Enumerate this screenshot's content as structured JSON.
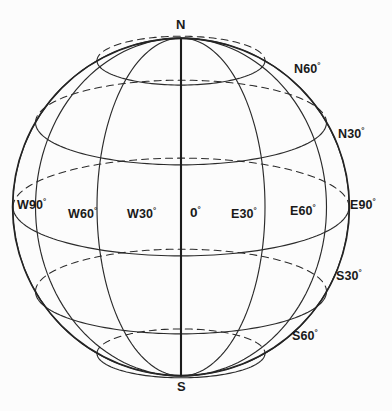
{
  "figure": {
    "background_color": "#fcfcfc",
    "line_color": "#2b2b2b",
    "axis_color": "#1c1c1c",
    "label_color": "#1a1a1a"
  },
  "geometry": {
    "center_x": 181,
    "center_y": 207,
    "radius_x": 168,
    "radius_y": 169,
    "latitude_step_deg": 30,
    "longitude_step_deg": 30,
    "latitudes_deg": [
      60,
      30,
      0,
      -30,
      -60
    ],
    "longitudes_deg": [
      -90,
      -60,
      -30,
      0,
      30,
      60,
      90
    ]
  },
  "labels": {
    "north_pole": {
      "text": "N",
      "x": 176,
      "y": 18
    },
    "south_pole": {
      "text": "S",
      "x": 177,
      "y": 380
    },
    "latitude": [
      {
        "text": "N60",
        "degree": "°",
        "x": 294,
        "y": 63
      },
      {
        "text": "N30",
        "degree": "°",
        "x": 338,
        "y": 128
      },
      {
        "text": "S30",
        "degree": "°",
        "x": 336,
        "y": 270
      },
      {
        "text": "S60",
        "degree": "°",
        "x": 292,
        "y": 330
      }
    ],
    "longitude": [
      {
        "text": "W90",
        "degree": "°",
        "x": 17,
        "y": 199
      },
      {
        "text": "W60",
        "degree": "°",
        "x": 68,
        "y": 208
      },
      {
        "text": "W30",
        "degree": "°",
        "x": 127,
        "y": 208
      },
      {
        "text": "0",
        "degree": "°",
        "x": 190,
        "y": 206
      },
      {
        "text": "E30",
        "degree": "°",
        "x": 231,
        "y": 208
      },
      {
        "text": "E60",
        "degree": "°",
        "x": 290,
        "y": 205
      },
      {
        "text": "E90",
        "degree": "°",
        "x": 350,
        "y": 199
      }
    ]
  },
  "chart_data": {
    "type": "diagram",
    "projection": "orthographic perspective sphere",
    "latitude_labels": [
      "N60°",
      "N30°",
      "0°",
      "S30°",
      "S60°"
    ],
    "longitude_labels": [
      "W90°",
      "W60°",
      "W30°",
      "0°",
      "E30°",
      "E60°",
      "E90°"
    ],
    "pole_labels": [
      "N",
      "S"
    ],
    "latitude_values": [
      60,
      30,
      0,
      -30,
      -60
    ],
    "longitude_values": [
      -90,
      -60,
      -30,
      0,
      30,
      60,
      90
    ],
    "line_styles": {
      "visible_front_arcs": "solid",
      "hidden_back_arcs": "dashed",
      "polar_axis": "solid thick"
    }
  }
}
